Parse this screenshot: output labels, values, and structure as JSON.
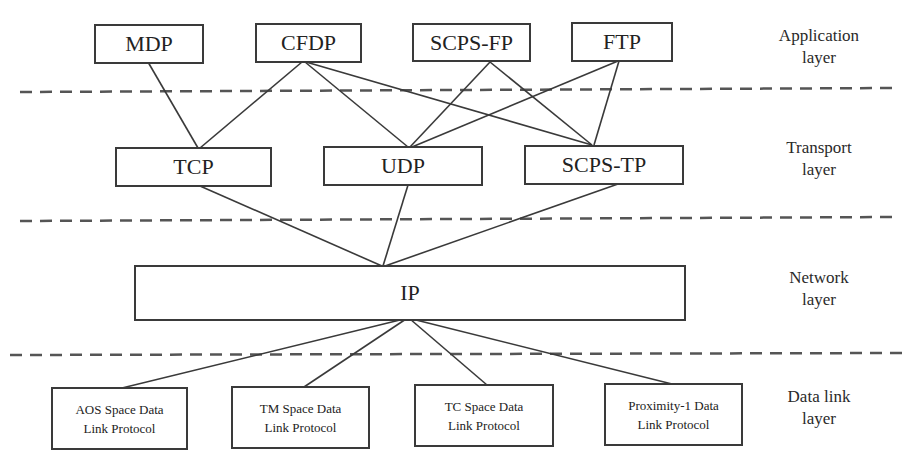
{
  "diagram": {
    "layers": [
      {
        "id": "application",
        "label": "Application\nlayer"
      },
      {
        "id": "transport",
        "label": "Transport\nlayer"
      },
      {
        "id": "network",
        "label": "Network\nlayer"
      },
      {
        "id": "datalink",
        "label": "Data link\nlayer"
      }
    ],
    "nodes": {
      "mdp": {
        "label": "MDP"
      },
      "cfdp": {
        "label": "CFDP"
      },
      "scpsfp": {
        "label": "SCPS-FP"
      },
      "ftp": {
        "label": "FTP"
      },
      "tcp": {
        "label": "TCP"
      },
      "udp": {
        "label": "UDP"
      },
      "scpstp": {
        "label": "SCPS-TP"
      },
      "ip": {
        "label": "IP"
      },
      "aos": {
        "label": "AOS Space Data\nLink Protocol"
      },
      "tm": {
        "label": "TM Space Data\nLink Protocol"
      },
      "tc": {
        "label": "TC Space Data\nLink Protocol"
      },
      "prox": {
        "label": "Proximity-1 Data\nLink Protocol"
      }
    },
    "edges": [
      [
        "MDP",
        "TCP"
      ],
      [
        "CFDP",
        "TCP"
      ],
      [
        "CFDP",
        "UDP"
      ],
      [
        "CFDP",
        "SCPS-TP"
      ],
      [
        "SCPS-FP",
        "UDP"
      ],
      [
        "SCPS-FP",
        "SCPS-TP"
      ],
      [
        "FTP",
        "UDP"
      ],
      [
        "FTP",
        "SCPS-TP"
      ],
      [
        "TCP",
        "IP"
      ],
      [
        "UDP",
        "IP"
      ],
      [
        "SCPS-TP",
        "IP"
      ],
      [
        "IP",
        "AOS Space Data Link Protocol"
      ],
      [
        "IP",
        "TM Space Data Link Protocol"
      ],
      [
        "IP",
        "TC Space Data Link Protocol"
      ],
      [
        "IP",
        "Proximity-1 Data Link Protocol"
      ]
    ],
    "colors": {
      "line": "#3a3a3a",
      "dash": "#555555",
      "background": "#ffffff"
    }
  }
}
